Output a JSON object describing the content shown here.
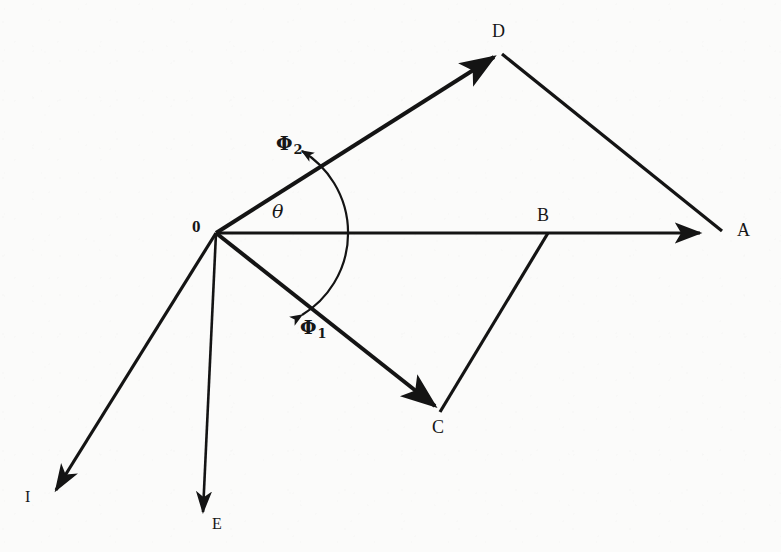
{
  "figure": {
    "type": "vector-phasor-diagram",
    "caption_fragment": "y",
    "background_color": "#fbfbfa",
    "stroke_color": "#141414",
    "canvas": {
      "width": 781,
      "height": 552
    }
  },
  "points": [
    {
      "id": "O",
      "label": "0",
      "x": 216,
      "y": 233,
      "label_x": 192,
      "label_y": 218,
      "role": "origin"
    },
    {
      "id": "A",
      "label": "A",
      "x": 723,
      "y": 233,
      "label_x": 737,
      "label_y": 221,
      "role": "resultant-tip"
    },
    {
      "id": "B",
      "label": "B",
      "x": 548,
      "y": 233,
      "label_x": 537,
      "label_y": 206,
      "role": "intermediate"
    },
    {
      "id": "C",
      "label": "C",
      "x": 440,
      "y": 412,
      "label_x": 432,
      "label_y": 418,
      "role": "phi1-tip"
    },
    {
      "id": "D",
      "label": "D",
      "x": 500,
      "y": 52,
      "label_x": 492,
      "label_y": 22,
      "role": "phi2-tip"
    },
    {
      "id": "E",
      "label": "E",
      "x": 203,
      "y": 528,
      "label_x": 212,
      "label_y": 516,
      "role": "vertical-tip"
    },
    {
      "id": "I",
      "label": "I",
      "x": 48,
      "y": 500,
      "label_x": 25,
      "label_y": 489,
      "role": "current-tip"
    }
  ],
  "vectors": [
    {
      "id": "OD",
      "name": "phi2-vector",
      "from": "O",
      "to": "D",
      "label": "Φ",
      "sublabel": "2",
      "label_x": 276,
      "label_y": 134,
      "arrow": "end",
      "width": 4.0
    },
    {
      "id": "OC",
      "name": "phi1-vector",
      "from": "O",
      "to": "C",
      "label": "Φ",
      "sublabel": "1",
      "label_x": 300,
      "label_y": 318,
      "arrow": "end",
      "width": 4.0
    },
    {
      "id": "OA",
      "name": "resultant-vector",
      "from": "O",
      "to": "A",
      "label": "",
      "sublabel": "",
      "arrow": "end",
      "width": 3.0
    },
    {
      "id": "OE",
      "name": "vertical-vector",
      "from": "O",
      "to": "E",
      "label": "",
      "sublabel": "",
      "arrow": "end",
      "width": 2.6
    },
    {
      "id": "OI",
      "name": "current-vector",
      "from": "O",
      "to": "I",
      "label": "",
      "sublabel": "",
      "arrow": "end",
      "width": 3.2
    },
    {
      "id": "DA",
      "name": "d-to-a-segment",
      "from": "D",
      "to": "A",
      "label": "",
      "sublabel": "",
      "arrow": "none",
      "width": 3.2
    },
    {
      "id": "CB",
      "name": "c-to-b-segment",
      "from": "C",
      "to": "B",
      "label": "",
      "sublabel": "",
      "arrow": "none",
      "width": 3.2
    }
  ],
  "angle": {
    "id": "theta",
    "symbol": "θ",
    "label_x": 272,
    "label_y": 202,
    "vertex": "O",
    "from_vector": "OC",
    "to_vector": "OD",
    "radius": 96,
    "arrow_both_ends": true,
    "measured_from_deg": -59,
    "measured_to_deg": 26
  }
}
